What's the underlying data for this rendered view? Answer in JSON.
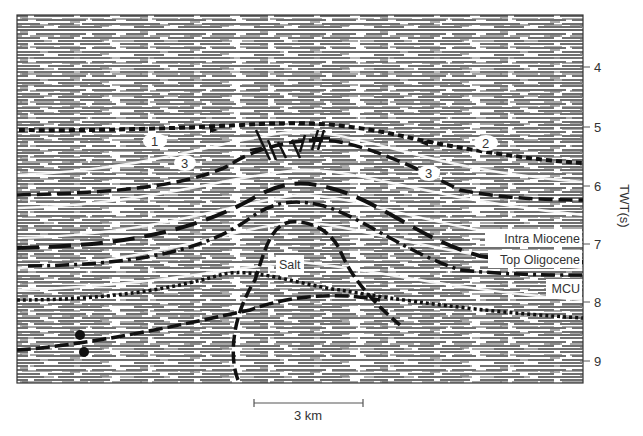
{
  "figure": {
    "type": "interpreted seismic section",
    "background_colors": {
      "paper": "#ffffff",
      "reflector_gray": "#6f6f6f",
      "interpretation_line": "#111111",
      "text": "#333333"
    }
  },
  "axis": {
    "title": "TWT(s)",
    "ticks": [
      {
        "value": "4",
        "y": 67
      },
      {
        "value": "5",
        "y": 127
      },
      {
        "value": "6",
        "y": 186
      },
      {
        "value": "7",
        "y": 244
      },
      {
        "value": "8",
        "y": 302
      },
      {
        "value": "9",
        "y": 361
      }
    ]
  },
  "horizons": [
    {
      "id": "intra-miocene",
      "label": "Intra Miocene"
    },
    {
      "id": "top-oligocene",
      "label": "Top Oligocene"
    },
    {
      "id": "mcu",
      "label": "MCU"
    }
  ],
  "body_labels": {
    "salt": "Salt"
  },
  "numbered_labels": [
    {
      "id": "label-1",
      "text": "1"
    },
    {
      "id": "label-2",
      "text": "2"
    },
    {
      "id": "label-3-left",
      "text": "3"
    },
    {
      "id": "label-3-right",
      "text": "3"
    }
  ],
  "scale_bar": {
    "label": "3 km"
  }
}
